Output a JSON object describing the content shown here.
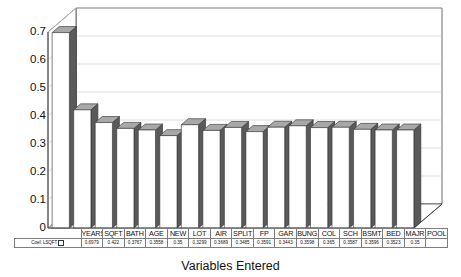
{
  "chart_data": {
    "type": "bar",
    "title": "Reg. Coeff. (elasticity)",
    "xlabel": "Variables Entered",
    "ylabel": "",
    "ylim": [
      0,
      0.7
    ],
    "yticks": [
      "0.7",
      "0.6",
      "0.5",
      "0.4",
      "0.3",
      "0.2",
      "0.1",
      "0"
    ],
    "grid": true,
    "legend_position": "bottom-left",
    "series_name": "Coef. LSQFT",
    "categories": [
      "YEARS",
      "SQFT",
      "BATH",
      "AGE",
      "NEW",
      "LOT",
      "AIR",
      "SPLIT",
      "FP",
      "GAR",
      "BUNG",
      "COL",
      "SCH",
      "BSMT",
      "BED",
      "MAJR",
      "POOL"
    ],
    "values": [
      0.6979,
      0.422,
      0.3767,
      0.3558,
      0.35,
      0.3299,
      0.3689,
      0.3485,
      0.3591,
      0.3443,
      0.3598,
      0.365,
      0.3587,
      0.3596,
      0.3523,
      0.35,
      0.35
    ],
    "value_labels": [
      "0.6979",
      "0.422",
      "0.3767",
      "0.3558",
      "0.35",
      "0.3299",
      "0.3689",
      "0.3485",
      "0.3591",
      "0.3443",
      "0.3598",
      "0.365",
      "0.3587",
      "0.3596",
      "0.3523",
      "0.35",
      ""
    ]
  },
  "table": {
    "legend_label": "Coef. LSQFT",
    "legend_swatch_color": "#ffffff"
  },
  "style": {
    "bar_face": "#ffffff",
    "bar_side": "#5a5a5a",
    "bar_top": "#a8a8a8",
    "axis": "#4a4a4a",
    "grid": "#cfcfcf"
  }
}
